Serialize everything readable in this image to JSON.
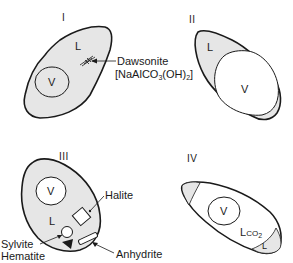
{
  "diagram": {
    "panels": [
      {
        "id": "I",
        "label": "I",
        "phases": {
          "vapor": "V",
          "liquid": "L"
        },
        "minerals": [
          {
            "name": "Dawsonite",
            "formula": "[NaAlCO",
            "formula_sub1": "3",
            "formula_mid": "(OH)",
            "formula_sub2": "2",
            "formula_end": "]"
          }
        ]
      },
      {
        "id": "II",
        "label": "II",
        "phases": {
          "vapor": "V",
          "liquid": "L"
        }
      },
      {
        "id": "III",
        "label": "III",
        "phases": {
          "vapor": "V",
          "liquid": "L"
        },
        "minerals": [
          {
            "name": "Halite"
          },
          {
            "name": "Sylvite"
          },
          {
            "name": "Hematite"
          },
          {
            "name": "Anhydrite"
          }
        ]
      },
      {
        "id": "IV",
        "label": "IV",
        "phases": {
          "vapor": "V",
          "liquid_co2": "L",
          "liquid_co2_sub": "CO",
          "liquid_co2_sub2": "2",
          "liquid": "L"
        }
      }
    ],
    "colors": {
      "outline": "#1a1a1a",
      "liquid_fill": "#e6e6e6",
      "vapor_fill": "#ffffff",
      "background": "#ffffff"
    }
  }
}
